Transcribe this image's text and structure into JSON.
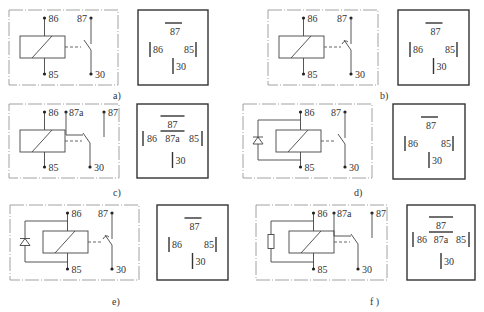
{
  "colors": {
    "ink": "#333333",
    "frame": "#8a8a8a",
    "background": "#ffffff"
  },
  "panels": [
    {
      "id": "a",
      "caption": "a)",
      "variant": "make-contact",
      "suppressor": "none",
      "pins": {
        "coil_top": "86",
        "coil_bottom": "85",
        "contact_no": "87",
        "common": "30"
      },
      "socket": {
        "top": "87",
        "left": "86",
        "right": "85",
        "bottom": "30"
      }
    },
    {
      "id": "b",
      "caption": "b)",
      "variant": "make-contact-delayed",
      "suppressor": "none",
      "pins": {
        "coil_top": "86",
        "coil_bottom": "85",
        "contact_no": "87",
        "common": "30"
      },
      "socket": {
        "top": "87",
        "left": "86",
        "right": "85",
        "bottom": "30"
      }
    },
    {
      "id": "c",
      "caption": "c)",
      "variant": "changeover",
      "suppressor": "none",
      "pins": {
        "coil_top": "86",
        "coil_bottom": "85",
        "contact_nc": "87a",
        "contact_no": "87",
        "common": "30"
      },
      "socket": {
        "top": "87",
        "left": "86",
        "center": "87a",
        "right": "85",
        "bottom": "30"
      }
    },
    {
      "id": "d",
      "caption": "d)",
      "variant": "make-contact",
      "suppressor": "diode",
      "pins": {
        "coil_top": "86",
        "coil_bottom": "85",
        "contact_no": "87",
        "common": "30"
      },
      "socket": {
        "top": "87",
        "left": "86",
        "right": "85",
        "bottom": "30"
      }
    },
    {
      "id": "e",
      "caption": "e)",
      "variant": "make-contact-delayed",
      "suppressor": "diode",
      "pins": {
        "coil_top": "86",
        "coil_bottom": "85",
        "contact_no": "87",
        "common": "30"
      },
      "socket": {
        "top": "87",
        "left": "86",
        "right": "85",
        "bottom": "30"
      }
    },
    {
      "id": "f",
      "caption": "f )",
      "variant": "changeover",
      "suppressor": "resistor",
      "pins": {
        "coil_top": "86",
        "coil_bottom": "85",
        "contact_nc": "87a",
        "contact_no": "87",
        "common": "30"
      },
      "socket": {
        "top": "87",
        "left": "86",
        "center": "87a",
        "right": "85",
        "bottom": "30"
      }
    }
  ]
}
